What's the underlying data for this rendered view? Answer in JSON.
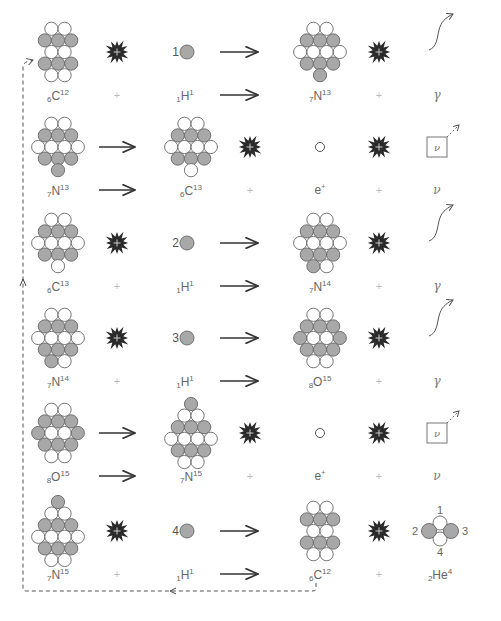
{
  "colors": {
    "proton": "#a8a8a8",
    "neutron": "#ffffff",
    "outline": "#666666",
    "burst": "#2a2a2a",
    "arrow": "#333333",
    "dashed": "#555555"
  },
  "steps": [
    {
      "type": "capture",
      "reactant": {
        "Z": "6",
        "symbol": "C",
        "A": "12",
        "rows": [
          "nn",
          "ppp",
          "nn",
          "ppp",
          "nn"
        ]
      },
      "proton_number": "1",
      "proton": {
        "Z": "1",
        "symbol": "H",
        "A": "1"
      },
      "product": {
        "Z": "7",
        "symbol": "N",
        "A": "13",
        "rows": [
          "nn",
          "ppp",
          "nnnn",
          "ppp",
          "p"
        ]
      },
      "emission": "γ",
      "plus": "+"
    },
    {
      "type": "decay",
      "reactant": {
        "Z": "7",
        "symbol": "N",
        "A": "13",
        "rows": [
          "nn",
          "ppp",
          "nnnn",
          "ppp",
          "p"
        ]
      },
      "product": {
        "Z": "6",
        "symbol": "C",
        "A": "13",
        "rows": [
          "nn",
          "ppp",
          "nnnn",
          "ppp",
          "n"
        ]
      },
      "electron": {
        "symbol": "e",
        "charge": "+"
      },
      "emission": "ν",
      "plus": "+"
    },
    {
      "type": "capture",
      "reactant": {
        "Z": "6",
        "symbol": "C",
        "A": "13",
        "rows": [
          "nn",
          "ppp",
          "nnnn",
          "ppp",
          "n"
        ]
      },
      "proton_number": "2",
      "proton": {
        "Z": "1",
        "symbol": "H",
        "A": "1"
      },
      "product": {
        "Z": "7",
        "symbol": "N",
        "A": "14",
        "rows": [
          "nn",
          "ppp",
          "nnnn",
          "ppp",
          "pn"
        ]
      },
      "emission": "γ",
      "plus": "+"
    },
    {
      "type": "capture",
      "reactant": {
        "Z": "7",
        "symbol": "N",
        "A": "14",
        "rows": [
          "nn",
          "ppp",
          "nnnn",
          "ppp",
          "pn"
        ]
      },
      "proton_number": "3",
      "proton": {
        "Z": "1",
        "symbol": "H",
        "A": "1"
      },
      "product": {
        "Z": "8",
        "symbol": "O",
        "A": "15",
        "rows": [
          "nn",
          "ppp",
          "pnnp",
          "ppp",
          "nn"
        ]
      },
      "emission": "γ",
      "plus": "+"
    },
    {
      "type": "decay",
      "reactant": {
        "Z": "8",
        "symbol": "O",
        "A": "15",
        "rows": [
          "nn",
          "ppp",
          "pnnp",
          "ppp",
          "nn"
        ]
      },
      "product": {
        "Z": "7",
        "symbol": "N",
        "A": "15",
        "rows": [
          "p",
          "nn",
          "ppp",
          "nnnn",
          "ppp",
          "nn"
        ]
      },
      "electron": {
        "symbol": "e",
        "charge": "+"
      },
      "emission": "ν",
      "plus": "+"
    },
    {
      "type": "capture",
      "reactant": {
        "Z": "7",
        "symbol": "N",
        "A": "15",
        "rows": [
          "p",
          "nn",
          "ppp",
          "nnnn",
          "ppp",
          "nn"
        ]
      },
      "proton_number": "4",
      "proton": {
        "Z": "1",
        "symbol": "H",
        "A": "1"
      },
      "product": {
        "Z": "6",
        "symbol": "C",
        "A": "12",
        "rows": [
          "nn",
          "ppp",
          "nn",
          "ppp",
          "nn"
        ]
      },
      "alpha": {
        "Z": "2",
        "symbol": "He",
        "A": "4",
        "labels": [
          "1",
          "2",
          "3",
          "4"
        ]
      },
      "plus": "+"
    }
  ]
}
